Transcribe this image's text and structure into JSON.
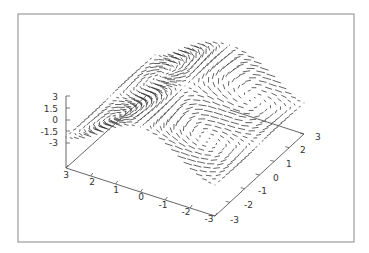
{
  "chart_data": {
    "type": "vector-field-3d",
    "title": "",
    "xlabel": "",
    "ylabel": "",
    "zlabel": "",
    "grid": false,
    "legend": null,
    "x_range": [
      -3,
      3
    ],
    "y_range": [
      -3,
      3
    ],
    "z_range": [
      -3,
      3
    ],
    "x_ticks": [
      "3",
      "2",
      "1",
      "0",
      "-1",
      "-2",
      "-3"
    ],
    "y_ticks": [
      "-3",
      "-2",
      "-1",
      "0",
      "1",
      "2",
      "3"
    ],
    "z_ticks": [
      "3",
      "1.5",
      "0",
      "-1.5",
      "-3"
    ],
    "vortex_centers_xy": [
      [
        1.5,
        -1.5
      ],
      [
        1.5,
        1.5
      ],
      [
        -1.5,
        -1.5
      ],
      [
        -1.5,
        1.5
      ]
    ],
    "grid_points_per_axis": 25,
    "line_color": "#222222"
  },
  "frame": {
    "border_color": "#888888"
  },
  "axes": {
    "z_labels": [
      {
        "text": "3",
        "y": 100
      },
      {
        "text": "1.5",
        "y": 112
      },
      {
        "text": "0",
        "y": 123
      },
      {
        "text": "-1.5",
        "y": 135
      },
      {
        "text": "-3",
        "y": 146
      }
    ],
    "x_labels": [
      {
        "text": "3",
        "x": 66,
        "y": 178
      },
      {
        "text": "2",
        "x": 92,
        "y": 185
      },
      {
        "text": "1",
        "x": 116,
        "y": 193
      },
      {
        "text": "0",
        "x": 141,
        "y": 200
      },
      {
        "text": "-1",
        "x": 163,
        "y": 208
      },
      {
        "text": "-2",
        "x": 186,
        "y": 215
      },
      {
        "text": "-3",
        "x": 209,
        "y": 222
      }
    ],
    "y_labels": [
      {
        "text": "-3",
        "x": 230,
        "y": 223
      },
      {
        "text": "-2",
        "x": 244,
        "y": 208
      },
      {
        "text": "-1",
        "x": 258,
        "y": 194
      },
      {
        "text": "0",
        "x": 273,
        "y": 181
      },
      {
        "text": "1",
        "x": 286,
        "y": 167
      },
      {
        "text": "2",
        "x": 300,
        "y": 153
      },
      {
        "text": "3",
        "x": 315,
        "y": 140
      }
    ]
  }
}
